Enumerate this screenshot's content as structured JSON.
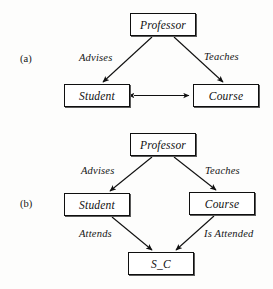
{
  "figure": {
    "background_color": "#fdfdfc",
    "line_color": "#101010",
    "box_fill": "#ffffff"
  },
  "panels": [
    {
      "id": "a",
      "label": "(a)",
      "nodes": [
        {
          "id": "professor_a",
          "label": "Professor",
          "x": 130,
          "y": 13,
          "w": 66,
          "h": 23
        },
        {
          "id": "student_a",
          "label": "Student",
          "x": 64,
          "y": 84,
          "w": 66,
          "h": 23
        },
        {
          "id": "course_a",
          "label": "Course",
          "x": 193,
          "y": 84,
          "w": 66,
          "h": 23
        }
      ],
      "edges": [
        {
          "id": "advises_a",
          "label": "Advises",
          "from": "professor_a",
          "to": "student_a",
          "arrow": "single"
        },
        {
          "id": "teaches_a",
          "label": "Teaches",
          "from": "professor_a",
          "to": "course_a",
          "arrow": "single"
        },
        {
          "id": "student_course_a",
          "label": "",
          "from": "student_a",
          "to": "course_a",
          "arrow": "double"
        }
      ],
      "edge_labels": [
        {
          "id": "advises_a_label",
          "text": "Advises",
          "x": 79,
          "y": 52
        },
        {
          "id": "teaches_a_label",
          "text": "Teaches",
          "x": 204,
          "y": 51
        }
      ],
      "panel_label_pos": {
        "x": 20,
        "y": 53
      }
    },
    {
      "id": "b",
      "label": "(b)",
      "nodes": [
        {
          "id": "professor_b",
          "label": "Professor",
          "x": 130,
          "y": 133,
          "w": 66,
          "h": 23
        },
        {
          "id": "student_b",
          "label": "Student",
          "x": 64,
          "y": 193,
          "w": 66,
          "h": 23
        },
        {
          "id": "course_b",
          "label": "Course",
          "x": 189,
          "y": 192,
          "w": 66,
          "h": 23
        },
        {
          "id": "s_c_b",
          "label": "S_C",
          "x": 128,
          "y": 252,
          "w": 66,
          "h": 23
        }
      ],
      "edges": [
        {
          "id": "advises_b",
          "label": "Advises",
          "from": "professor_b",
          "to": "student_b",
          "arrow": "single"
        },
        {
          "id": "teaches_b",
          "label": "Teaches",
          "from": "professor_b",
          "to": "course_b",
          "arrow": "single"
        },
        {
          "id": "attends_b",
          "label": "Attends",
          "from": "student_b",
          "to": "s_c_b",
          "arrow": "single"
        },
        {
          "id": "is_attended_b",
          "label": "Is Attended",
          "from": "course_b",
          "to": "s_c_b",
          "arrow": "single"
        }
      ],
      "edge_labels": [
        {
          "id": "advises_b_label",
          "text": "Advises",
          "x": 81,
          "y": 165
        },
        {
          "id": "teaches_b_label",
          "text": "Teaches",
          "x": 205,
          "y": 165
        },
        {
          "id": "attends_b_label",
          "text": "Attends",
          "x": 79,
          "y": 228
        },
        {
          "id": "is_attended_b_label",
          "text": "Is Attended",
          "x": 204,
          "y": 228
        }
      ],
      "panel_label_pos": {
        "x": 20,
        "y": 198
      }
    }
  ]
}
